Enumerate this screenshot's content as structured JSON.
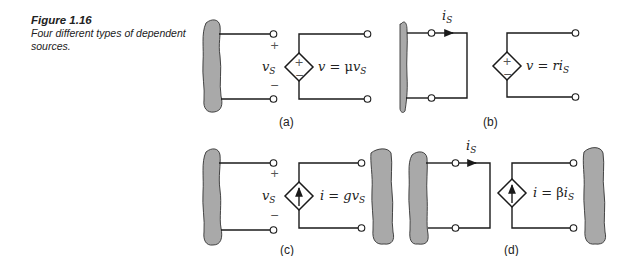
{
  "caption": {
    "figure_number": "Figure 1.16",
    "text": "Four different types of dependent sources."
  },
  "panels": {
    "a": {
      "label": "(a)",
      "control_variable": "v",
      "control_sub": "S",
      "plus": "+",
      "minus": "−",
      "source_type": "voltage-controlled voltage source",
      "eq_lhs": "v",
      "eq_sign": " = ",
      "eq_coef": "μ",
      "eq_var": "v",
      "eq_sub": "S",
      "src_plus": "+",
      "src_minus": "−"
    },
    "b": {
      "label": "(b)",
      "control_variable": "i",
      "control_sub": "S",
      "source_type": "current-controlled voltage source",
      "eq_lhs": "v",
      "eq_sign": " = ",
      "eq_coef": "r",
      "eq_var": "i",
      "eq_sub": "S",
      "src_plus": "+",
      "src_minus": "−"
    },
    "c": {
      "label": "(c)",
      "control_variable": "v",
      "control_sub": "S",
      "plus": "+",
      "minus": "−",
      "source_type": "voltage-controlled current source",
      "eq_lhs": "i",
      "eq_sign": " = ",
      "eq_coef": "g",
      "eq_var": "v",
      "eq_sub": "S"
    },
    "d": {
      "label": "(d)",
      "control_variable": "i",
      "control_sub": "S",
      "source_type": "current-controlled current source",
      "eq_lhs": "i",
      "eq_sign": " = ",
      "eq_coef": "β",
      "eq_var": "i",
      "eq_sub": "S"
    }
  },
  "colors": {
    "wire": "#1a1a1a",
    "blob_fill": "#a9a9a9",
    "background": "#ffffff"
  }
}
